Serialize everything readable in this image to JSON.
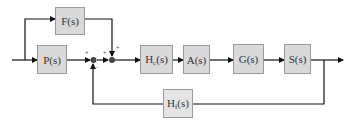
{
  "diagram": {
    "type": "control-system-block-diagram",
    "colors": {
      "block_fill": "#d9d9d9",
      "block_border": "#9a9a9a",
      "line": "#111111"
    },
    "blocks": [
      {
        "id": "F",
        "label": "F(s)",
        "base": "H",
        "sub": ""
      },
      {
        "id": "P",
        "label": "P(s)"
      },
      {
        "id": "Hc",
        "base": "H",
        "sub": "c",
        "suffix": "(s)"
      },
      {
        "id": "A",
        "label": "A(s)"
      },
      {
        "id": "G",
        "label": "G(s)"
      },
      {
        "id": "S",
        "label": "S(s)"
      },
      {
        "id": "Hf",
        "base": "H",
        "sub": "f",
        "suffix": "(s)"
      }
    ],
    "summing_junctions": [
      {
        "id": "sum1",
        "signs": {
          "left": "+",
          "bottom": "-"
        }
      },
      {
        "id": "sum2",
        "signs": {
          "left": "+",
          "top": "+"
        }
      }
    ]
  }
}
